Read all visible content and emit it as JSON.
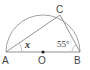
{
  "diagram": {
    "type": "semicircle-inscribed-triangle",
    "points": {
      "A": {
        "label": "A",
        "x": 6,
        "y": 52
      },
      "O": {
        "label": "O",
        "x": 43,
        "y": 52
      },
      "B": {
        "label": "B",
        "x": 80,
        "y": 52
      },
      "C": {
        "label": "C",
        "x": 60,
        "y": 15
      }
    },
    "angles": {
      "at_A": {
        "label": "x"
      },
      "at_B": {
        "label": "55°"
      }
    },
    "colors": {
      "stroke": "#888888",
      "center_dot": "#222222",
      "text": "#444444"
    }
  }
}
